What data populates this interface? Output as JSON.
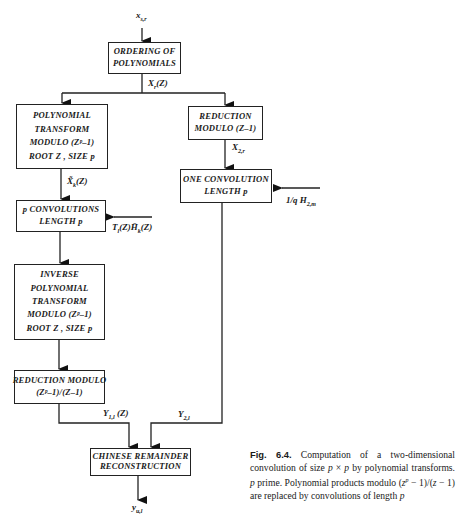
{
  "diagram": {
    "input_label": "x",
    "input_sub": "s,r",
    "boxes": {
      "ordering": [
        "ORDERING OF",
        "POLYNOMIALS"
      ],
      "poly_transform": [
        "POLYNOMIAL",
        "TRANSFORM",
        "MODULO (Zᵖ–1)",
        "ROOT Z , SIZE p"
      ],
      "reduction_z1": [
        "REDUCTION",
        "MODULO (Z–1)"
      ],
      "p_convolutions": [
        "p CONVOLUTIONS",
        "LENGTH p"
      ],
      "one_convolution": [
        "ONE CONVOLUTION",
        "LENGTH p"
      ],
      "inverse_transform": [
        "INVERSE",
        "POLYNOMIAL",
        "TRANSFORM",
        "MODULO (Zᵖ–1)",
        "ROOT Z , SIZE p"
      ],
      "reduction_modulo": [
        "REDUCTION MODULO",
        "(Zᵖ–1)/(Z–1)"
      ],
      "chinese_remainder": [
        "CHINESE REMAINDER",
        "RECONSTRUCTION"
      ]
    },
    "signals": {
      "xr": "X",
      "xr_sub": "r",
      "xr_arg": "(Z)",
      "xk": "X̃",
      "xk_sub": "k",
      "xk_arg": "(Z)",
      "x2r": "X",
      "x2r_sub": "2,r",
      "t_h": "T",
      "t_h_sub": "l",
      "t_h_mid": "(Z)H̄",
      "t_h_sub2": "k",
      "t_h_arg": "(Z)",
      "h2m_prefix": "1/q  H",
      "h2m_sub": "2,m",
      "y1l": "Y",
      "y1l_sub": "1,l",
      "y1l_arg": " (Z)",
      "y2l": "Y",
      "y2l_sub": "2,l",
      "output": "y",
      "output_sub": "u,l"
    }
  },
  "caption": {
    "figure_number": "Fig. 6.4.",
    "text_1": " Computation of a two-dimensional convolution of size ",
    "p1": "p",
    "times": " × ",
    "p2": "p",
    "text_2": " by polynomial transforms. ",
    "p3": "p",
    "text_3": " prime. Polynomial products modulo (",
    "z1": "z",
    "zp": "p",
    "text_4": " − 1)/(",
    "z2": "z",
    "text_5": " − 1) are replaced by convolutions of length ",
    "p4": "p"
  }
}
